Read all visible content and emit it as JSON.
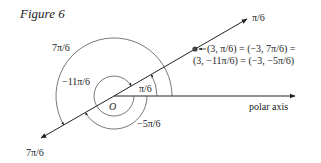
{
  "figure": {
    "title": "Figure 6",
    "origin_label": "O",
    "ray_label_end": "π/6",
    "ray_label_opposite": "7π/6",
    "axis_label": "polar axis",
    "angle_labels": {
      "pi_over_6": "π/6",
      "seven_pi_over_6": "7π/6",
      "neg_eleven_pi_over_6": "−11π/6",
      "neg_five_pi_over_6": "−5π/6"
    },
    "point_label_line1": "(3, π/6) = (−3, 7π/6) =",
    "point_label_line2": "(3, −11π/6) = (−3, −5π/6)",
    "colors": {
      "ink": "#222222",
      "arc": "#555555",
      "background": "#ffffff"
    }
  }
}
